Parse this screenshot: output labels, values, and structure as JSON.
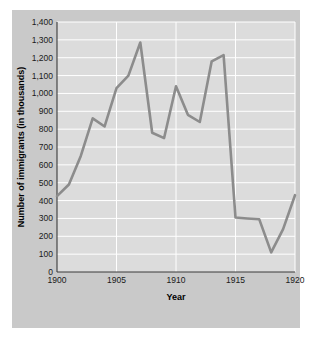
{
  "chart_data": {
    "type": "line",
    "title": "",
    "xlabel": "Year",
    "ylabel": "Number of immigrants (in thousands)",
    "xlim": [
      1900,
      1920
    ],
    "ylim": [
      0,
      1400
    ],
    "grid": true,
    "legend": false,
    "line_color": "#8c8c8c",
    "plot_background": "#dcdcdc",
    "panel_background": "#c9c9c9",
    "gridline_color": "#ffffff",
    "x": [
      1900,
      1901,
      1902,
      1903,
      1904,
      1905,
      1906,
      1907,
      1908,
      1909,
      1910,
      1911,
      1912,
      1913,
      1914,
      1915,
      1916,
      1917,
      1918,
      1919,
      1920
    ],
    "values": [
      425,
      490,
      650,
      860,
      815,
      1030,
      1100,
      1285,
      780,
      750,
      1040,
      880,
      840,
      1180,
      1215,
      305,
      300,
      295,
      110,
      240,
      430
    ],
    "ytick_labels": [
      "0",
      "100",
      "200",
      "300",
      "400",
      "500",
      "600",
      "700",
      "800",
      "900",
      "1,000",
      "1,100",
      "1,200",
      "1,300",
      "1,400"
    ],
    "ytick_values": [
      0,
      100,
      200,
      300,
      400,
      500,
      600,
      700,
      800,
      900,
      1000,
      1100,
      1200,
      1300,
      1400
    ],
    "xtick_labels": [
      "1900",
      "1905",
      "1910",
      "1915",
      "1920"
    ],
    "xtick_values": [
      1900,
      1905,
      1910,
      1915,
      1920
    ]
  }
}
